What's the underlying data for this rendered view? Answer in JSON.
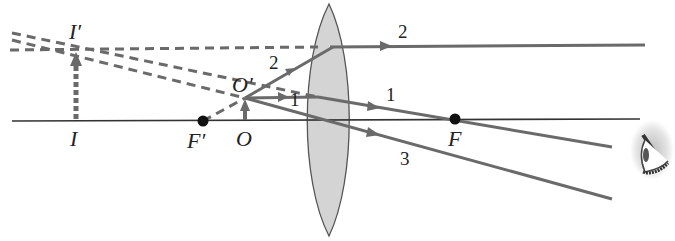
{
  "diagram": {
    "colors": {
      "ray": "#6a6a6a",
      "axis": "#333333",
      "lens_fill": "#d4d4d4",
      "lens_stroke": "#555555",
      "focal_point": "#111111",
      "label": "#222222"
    },
    "labels": {
      "image_top": "I′",
      "image_base": "I",
      "object_top": "O′",
      "object_base": "O",
      "focal_left": "F′",
      "focal_right": "F"
    },
    "ray_labels": {
      "ray1_before": "1",
      "ray1_after": "1",
      "ray2_before": "2",
      "ray2_after": "2",
      "ray3": "3"
    },
    "elements": {
      "optical_axis": "optical axis",
      "lens": "converging lens",
      "object": "object arrow OO′",
      "image": "virtual image arrow II′",
      "eye": "observer eye"
    }
  }
}
